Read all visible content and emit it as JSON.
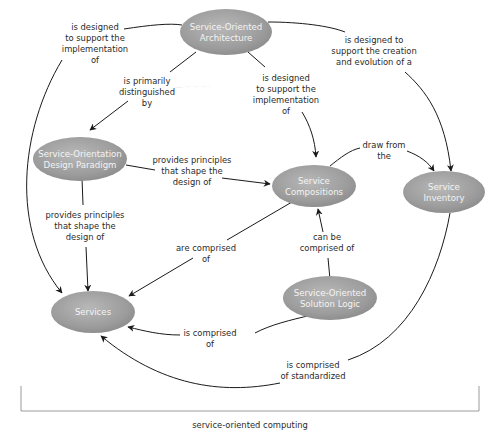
{
  "diagram": {
    "title": "service-oriented computing",
    "colors": {
      "node_fill_light": "#b5b5b5",
      "node_fill_dark": "#8a8a8a",
      "node_text": "#f4f4f4",
      "edge": "#1a1a1a",
      "label_text": "#2a2a2a",
      "bracket": "#9a9a9a"
    },
    "nodes": [
      {
        "id": "soa",
        "lines": [
          "Service-Oriented",
          "Architecture"
        ]
      },
      {
        "id": "sodp",
        "lines": [
          "Service-Orientation",
          "Design Paradigm"
        ]
      },
      {
        "id": "compositions",
        "lines": [
          "Service",
          "Compositions"
        ]
      },
      {
        "id": "inventory",
        "lines": [
          "Service",
          "Inventory"
        ]
      },
      {
        "id": "sosl",
        "lines": [
          "Service-Oriented",
          "Solution Logic"
        ]
      },
      {
        "id": "services",
        "lines": [
          "Services"
        ]
      }
    ],
    "edges": [
      {
        "from": "soa",
        "to": "services",
        "label": [
          "is designed",
          "to support the",
          "implementation",
          "of"
        ]
      },
      {
        "from": "soa",
        "to": "sodp",
        "label": [
          "is primarily",
          "distinguished",
          "by"
        ]
      },
      {
        "from": "soa",
        "to": "compositions",
        "label": [
          "is designed",
          "to support the",
          "implementation",
          "of"
        ]
      },
      {
        "from": "soa",
        "to": "inventory",
        "label": [
          "is designed to",
          "support the creation",
          "and evolution of a"
        ]
      },
      {
        "from": "sodp",
        "to": "compositions",
        "label": [
          "provides principles",
          "that shape the",
          "design of"
        ]
      },
      {
        "from": "sodp",
        "to": "services",
        "label": [
          "provides principles",
          "that shape the",
          "design of"
        ]
      },
      {
        "from": "compositions",
        "to": "inventory",
        "label": [
          "draw from",
          "the"
        ]
      },
      {
        "from": "compositions",
        "to": "services",
        "label": [
          "are comprised",
          "of"
        ]
      },
      {
        "from": "sosl",
        "to": "compositions",
        "label": [
          "can be",
          "comprised of"
        ]
      },
      {
        "from": "sosl",
        "to": "services",
        "label": [
          "is comprised",
          "of"
        ]
      },
      {
        "from": "inventory",
        "to": "services",
        "label": [
          "is comprised",
          "of standardized"
        ]
      }
    ]
  }
}
